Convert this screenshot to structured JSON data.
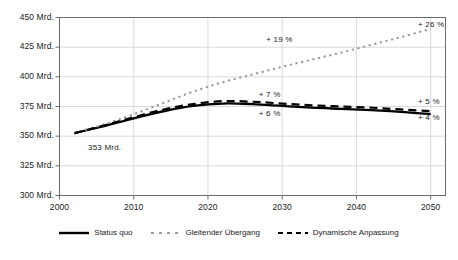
{
  "chart_data": {
    "type": "line",
    "title": "",
    "xlabel": "",
    "ylabel": "",
    "xlim": [
      2000,
      2052
    ],
    "ylim": [
      300,
      450
    ],
    "grid": true,
    "grid_axis": "both",
    "legend_position": "bottom-center",
    "y_unit": "Mrd.",
    "yticks": [
      300,
      325,
      350,
      375,
      400,
      425,
      450
    ],
    "ytick_labels": [
      "300 Mrd.",
      "325 Mrd.",
      "350 Mrd.",
      "375 Mrd.",
      "400 Mrd.",
      "425 Mrd.",
      "450 Mrd."
    ],
    "xticks": [
      2000,
      2010,
      2020,
      2030,
      2040,
      2050
    ],
    "xtick_labels": [
      "2000",
      "2010",
      "2020",
      "2030",
      "2040",
      "2050"
    ],
    "x": [
      2002,
      2006,
      2010,
      2014,
      2018,
      2022,
      2026,
      2030,
      2034,
      2038,
      2042,
      2046,
      2050
    ],
    "series": [
      {
        "name": "Status quo",
        "style": "solid",
        "color": "#000000",
        "values": [
          352.5,
          358.5,
          365.0,
          371.0,
          375.5,
          377.5,
          377.0,
          375.5,
          374.0,
          373.0,
          372.0,
          370.5,
          368.5
        ]
      },
      {
        "name": "Gleitender Übergang",
        "style": "dotted",
        "color": "#9a9a9a",
        "values": [
          352.5,
          360.0,
          368.5,
          378.0,
          387.5,
          395.5,
          402.0,
          408.5,
          414.5,
          420.5,
          427.0,
          433.5,
          440.5
        ]
      },
      {
        "name": "Dynamische Anpassung",
        "style": "dashed",
        "color": "#000000",
        "values": [
          352.5,
          359.0,
          366.0,
          372.5,
          377.0,
          379.5,
          379.0,
          377.5,
          376.0,
          375.0,
          374.0,
          372.5,
          371.0
        ]
      }
    ],
    "annotations": [
      {
        "text": "+ 19 %",
        "x_value": 2030,
        "y_value": 431,
        "series": "Gleitender Übergang"
      },
      {
        "text": "+ 26 %",
        "x_value": 2051,
        "y_value": 444,
        "series": "Gleitender Übergang"
      },
      {
        "text": "+ 7 %",
        "x_value": 2029,
        "y_value": 385,
        "series": "Dynamische Anpassung"
      },
      {
        "text": "+ 6 %",
        "x_value": 2029,
        "y_value": 369,
        "series": "Status quo"
      },
      {
        "text": "+ 5 %",
        "x_value": 2051,
        "y_value": 379,
        "series": "Dynamische Anpassung"
      },
      {
        "text": "+ 4 %",
        "x_value": 2051,
        "y_value": 365,
        "series": "Status quo"
      },
      {
        "text": "353 Mrd.",
        "x_value": 2006,
        "y_value": 340,
        "series": "Status quo"
      }
    ]
  },
  "legend": {
    "items": [
      {
        "label": "Status quo"
      },
      {
        "label": "Gleitender Übergang"
      },
      {
        "label": "Dynamische Anpassung"
      }
    ]
  },
  "colors": {
    "axis": "#6b6b6b",
    "grid": "#d0d0d0",
    "solid_series": "#000000",
    "dotted_series": "#9a9a9a",
    "dashed_series": "#000000",
    "text": "#1a1a1a",
    "background": "#ffffff"
  }
}
